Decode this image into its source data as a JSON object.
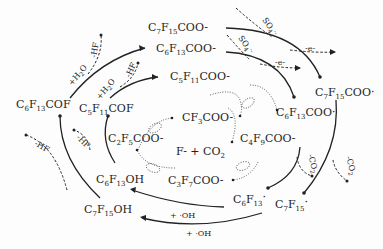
{
  "diagram": {
    "type": "reaction-cycle",
    "species": {
      "c7f15coo_top": {
        "base": "C",
        "n1": "7",
        "mid": "F",
        "n2": "15",
        "tail": "COO",
        "charge": "-"
      },
      "c6f13coo_top": {
        "base": "C",
        "n1": "6",
        "mid": "F",
        "n2": "13",
        "tail": "COO",
        "charge": "-"
      },
      "c5f11coo": {
        "base": "C",
        "n1": "5",
        "mid": "F",
        "n2": "11",
        "tail": "COO",
        "charge": "-"
      },
      "c7f15coo_radical": {
        "base": "C",
        "n1": "7",
        "mid": "F",
        "n2": "15",
        "tail": "COO",
        "charge": "·"
      },
      "c6f13coo_radical": {
        "base": "C",
        "n1": "6",
        "mid": "F",
        "n2": "13",
        "tail": "COO",
        "charge": "·"
      },
      "c6f13cof": {
        "base": "C",
        "n1": "6",
        "mid": "F",
        "n2": "13",
        "tail": "COF"
      },
      "c5f11cof": {
        "base": "C",
        "n1": "5",
        "mid": "F",
        "n2": "11",
        "tail": "COF"
      },
      "cf3coo": {
        "base": "CF",
        "n1": "3",
        "tail": "COO",
        "charge": "-"
      },
      "c2f5coo": {
        "base": "C",
        "n1": "2",
        "mid": "F",
        "n2": "5",
        "tail": "COO",
        "charge": "-"
      },
      "c4f9coo": {
        "base": "C",
        "n1": "4",
        "mid": "F",
        "n2": "9",
        "tail": "COO",
        "charge": "-"
      },
      "c3f7coo": {
        "base": "C",
        "n1": "3",
        "mid": "F",
        "n2": "7",
        "tail": "COO",
        "charge": "-"
      },
      "center": {
        "text": "F- + CO",
        "sub": "2"
      },
      "c6f13oh": {
        "base": "C",
        "n1": "6",
        "mid": "F",
        "n2": "13",
        "tail": "OH"
      },
      "c7f15oh": {
        "base": "C",
        "n1": "7",
        "mid": "F",
        "n2": "15",
        "tail": "OH"
      },
      "c6f13_radical": {
        "base": "C",
        "n1": "6",
        "mid": "F",
        "n2": "13",
        "charge": "·"
      },
      "c7f15_radical": {
        "base": "C",
        "n1": "7",
        "mid": "F",
        "n2": "15",
        "charge": "·"
      }
    },
    "reagents": {
      "h2o_outer": "+H2O",
      "h2o_inner": "+H2O",
      "hf_top_outer": "-HF",
      "hf_top_inner": "-HF",
      "hf_left_outer": "-HF",
      "hf_left_inner": "-HF",
      "so4_outer": "SO4·-",
      "so4_inner": "SO4·-",
      "e_outer": "-e-",
      "e_inner": "-e-",
      "co2_outer": "-CO2",
      "co2_inner": "-CO2",
      "oh_inner": "+ ·OH",
      "oh_outer": "+ ·OH"
    }
  }
}
